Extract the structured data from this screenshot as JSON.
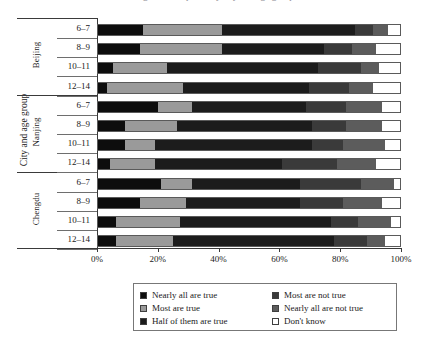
{
  "title": "Figure: Perceptions by city and age group",
  "axes": {
    "y_title": "City and age group",
    "x_ticks": [
      "0%",
      "20%",
      "40%",
      "60%",
      "80%",
      "100%"
    ]
  },
  "cities": [
    {
      "name": "Beijing"
    },
    {
      "name": "Nanjing"
    },
    {
      "name": "Chengdu"
    }
  ],
  "age_groups": [
    "6–7",
    "8–9",
    "10–11",
    "12–14"
  ],
  "legend": {
    "col1": [
      {
        "label": "Nearly all are true",
        "swatch": "sw0"
      },
      {
        "label": "Most are true",
        "swatch": "sw1"
      },
      {
        "label": "Half of them are true",
        "swatch": "sw2"
      }
    ],
    "col2": [
      {
        "label": "Most are not true",
        "swatch": "sw3"
      },
      {
        "label": "Nearly all are not true",
        "swatch": "sw4"
      },
      {
        "label": "Don't know",
        "swatch": "sw5"
      }
    ]
  },
  "chart_data": {
    "type": "bar",
    "orientation": "horizontal",
    "stacked": true,
    "normalized": true,
    "title": "Figure: Perceptions by city and age group",
    "xlabel": "",
    "ylabel": "City and age group",
    "xlim": [
      0,
      100
    ],
    "xticks": [
      0,
      20,
      40,
      60,
      80,
      100
    ],
    "grid": false,
    "legend_position": "bottom",
    "categories": [
      "Beijing 6–7",
      "Beijing 8–9",
      "Beijing 10–11",
      "Beijing 12–14",
      "Nanjing 6–7",
      "Nanjing 8–9",
      "Nanjing 10–11",
      "Nanjing 12–14",
      "Chengdu 6–7",
      "Chengdu 8–9",
      "Chengdu 10–11",
      "Chengdu 12–14"
    ],
    "series": [
      {
        "name": "Nearly all are true",
        "values": [
          15,
          14,
          5,
          3,
          20,
          9,
          9,
          4,
          21,
          14,
          6,
          6
        ]
      },
      {
        "name": "Most are true",
        "values": [
          26,
          27,
          18,
          25,
          11,
          17,
          10,
          15,
          10,
          15,
          21,
          19
        ]
      },
      {
        "name": "Half of them are true",
        "values": [
          44,
          34,
          50,
          42,
          38,
          45,
          52,
          42,
          36,
          38,
          50,
          53
        ]
      },
      {
        "name": "Most are not true",
        "values": [
          6,
          9,
          14,
          13,
          13,
          11,
          10,
          18,
          20,
          14,
          9,
          11
        ]
      },
      {
        "name": "Nearly all are not true",
        "values": [
          5,
          8,
          6,
          8,
          12,
          12,
          14,
          13,
          11,
          13,
          11,
          6
        ]
      },
      {
        "name": "Don't know",
        "values": [
          4,
          8,
          7,
          9,
          6,
          6,
          5,
          8,
          2,
          6,
          3,
          5
        ]
      }
    ]
  }
}
